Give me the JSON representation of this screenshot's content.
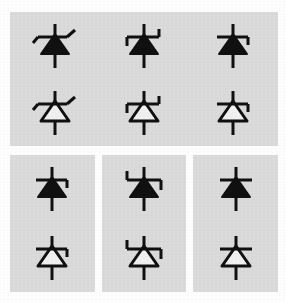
{
  "figure": {
    "background_color": "#ffffff",
    "panel_background_color": "#dcdcdc",
    "stroke_color": "#111111",
    "fill_solid_color": "#111111",
    "fill_hollow_color": "#f2f2f2"
  },
  "panels": [
    {
      "id": "panel-1",
      "name": "panel-group-top",
      "label": "Top combined panel",
      "symbols": [
        {
          "id": "sym-1a",
          "name": "diode-symbol-s-bar-filled",
          "label": "Diode, S-shaped cathode bar, filled triangle",
          "bar_style": "s-diagonal",
          "triangle_fill": "solid"
        },
        {
          "id": "sym-1b",
          "name": "diode-symbol-s-bar-hollow",
          "label": "Diode, S-shaped cathode bar, hollow triangle",
          "bar_style": "s-diagonal",
          "triangle_fill": "hollow"
        },
        {
          "id": "sym-2a",
          "name": "diode-symbol-z-bar-filled",
          "label": "Zener diode, Z cathode bar, filled triangle",
          "bar_style": "z-bar",
          "triangle_fill": "solid"
        },
        {
          "id": "sym-2b",
          "name": "diode-symbol-z-bar-hollow",
          "label": "Zener diode, Z cathode bar, hollow triangle",
          "bar_style": "z-bar",
          "triangle_fill": "hollow"
        },
        {
          "id": "sym-3a",
          "name": "diode-symbol-right-tick-filled",
          "label": "Diode, cathode bar with right downward tick, filled triangle",
          "bar_style": "right-tick",
          "triangle_fill": "solid"
        },
        {
          "id": "sym-3b",
          "name": "diode-symbol-right-tick-hollow",
          "label": "Diode, cathode bar with right downward tick, hollow triangle",
          "bar_style": "right-tick",
          "triangle_fill": "hollow"
        }
      ]
    },
    {
      "id": "panel-4",
      "name": "panel-right-tick",
      "label": "Panel 4",
      "symbols": [
        {
          "id": "sym-4a",
          "name": "diode-symbol-right-tick-filled",
          "label": "Diode, cathode bar with right downward tick, filled triangle",
          "bar_style": "right-tick",
          "triangle_fill": "solid"
        },
        {
          "id": "sym-4b",
          "name": "diode-symbol-right-tick-hollow",
          "label": "Diode, cathode bar with right downward tick, hollow triangle",
          "bar_style": "right-tick",
          "triangle_fill": "hollow"
        }
      ]
    },
    {
      "id": "panel-5",
      "name": "panel-z-bar",
      "label": "Panel 5",
      "symbols": [
        {
          "id": "sym-5a",
          "name": "diode-symbol-z-bar-filled",
          "label": "Zener diode, Z cathode bar, filled triangle",
          "bar_style": "z-bar",
          "triangle_fill": "solid"
        },
        {
          "id": "sym-5b",
          "name": "diode-symbol-z-bar-hollow",
          "label": "Zener diode, Z cathode bar, hollow triangle",
          "bar_style": "z-bar",
          "triangle_fill": "hollow"
        }
      ]
    },
    {
      "id": "panel-6",
      "name": "panel-plain-bar",
      "label": "Panel 6",
      "symbols": [
        {
          "id": "sym-6a",
          "name": "diode-symbol-plain-bar-filled",
          "label": "Standard diode, plain cathode bar, filled triangle",
          "bar_style": "plain",
          "triangle_fill": "solid"
        },
        {
          "id": "sym-6b",
          "name": "diode-symbol-plain-bar-hollow",
          "label": "Standard diode, plain cathode bar, hollow triangle",
          "bar_style": "plain",
          "triangle_fill": "hollow"
        }
      ]
    }
  ]
}
